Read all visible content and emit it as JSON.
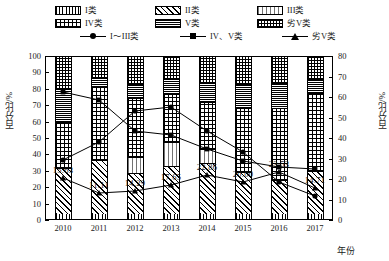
{
  "chart_data": {
    "type": "bar",
    "title": "",
    "xlabel": "年份",
    "ylabel": "百分比/%",
    "ylabel_right": "百分比/%",
    "categories": [
      "2010",
      "2011",
      "2012",
      "2013",
      "2014",
      "2015",
      "2016",
      "2017"
    ],
    "ylim": [
      0,
      100
    ],
    "ylim_right": [
      0,
      80
    ],
    "yticks": [
      "0",
      "10",
      "20",
      "30",
      "40",
      "50",
      "60",
      "70",
      "80",
      "90",
      "100"
    ],
    "yticks_right": [
      "0",
      "10",
      "20",
      "30",
      "40",
      "50",
      "60",
      "70",
      "80"
    ],
    "grid": false,
    "legend_position": "top",
    "stacked": true,
    "series": [
      {
        "name": "I类",
        "pattern": "vertical-bars",
        "values": [
          3.1,
          2.8,
          3.0,
          3.0,
          2.9,
          2.9,
          2.9,
          3.0
        ]
      },
      {
        "name": "II类",
        "pattern": "diagonal-hatch",
        "values": [
          28.0,
          33.3,
          25.0,
          29.4,
          31.4,
          26.0,
          21.0,
          26.5
        ]
      },
      {
        "name": "III类",
        "pattern": "sparse-dots",
        "values": [
          0.0,
          0.0,
          10.0,
          14.7,
          8.6,
          0.0,
          0.0,
          0.0
        ]
      },
      {
        "name": "IV类",
        "pattern": "coarse-checker",
        "values": [
          28.1,
          44.4,
          35.7,
          29.4,
          28.6,
          39.0,
          44.1,
          47.1
        ]
      },
      {
        "name": "V类",
        "pattern": "dense-lines",
        "values": [
          20.3,
          5.6,
          8.6,
          8.8,
          11.4,
          14.7,
          14.7,
          8.8
        ]
      },
      {
        "name": "劣V类",
        "pattern": "fine-cross",
        "values": [
          20.5,
          13.9,
          17.7,
          14.7,
          17.1,
          17.4,
          17.3,
          14.6
        ]
      }
    ],
    "line_series": [
      {
        "name": "I~III类",
        "marker": "circle",
        "axis": "right",
        "values": [
          25.0,
          36.4,
          46.9,
          53.1,
          52.8,
          34.4,
          15.2,
          9.4
        ],
        "pixel_y": [
          160,
          142,
          111,
          107,
          131,
          152,
          182,
          196
        ]
      },
      {
        "name": "IV、V类",
        "marker": "square",
        "axis": "right",
        "values": [
          59.4,
          52.0,
          40.0,
          30.6,
          31.4,
          45.3,
          58.8,
          63.0
        ],
        "pixel_y": [
          92,
          100,
          131,
          135,
          149,
          161,
          167,
          169
        ]
      },
      {
        "name": "劣V类",
        "marker": "triangle",
        "axis": "right",
        "values": [
          15.63,
          11.11,
          14.29,
          17.65,
          22.86,
          20.0,
          23.53,
          14.71
        ],
        "labels": [
          "15.63",
          "11.11",
          "14.29",
          "17.65",
          "22.86",
          "20.00",
          "23.53",
          "14.71"
        ],
        "pixel_y": [
          178,
          193,
          191,
          185,
          175,
          182,
          172,
          188
        ]
      }
    ]
  },
  "legend": {
    "items": [
      {
        "key": "I",
        "label": "I类",
        "pattern": "vertical-bars",
        "type": "swatch"
      },
      {
        "key": "II",
        "label": "II类",
        "pattern": "diagonal-hatch",
        "type": "swatch"
      },
      {
        "key": "III",
        "label": "III类",
        "pattern": "sparse-dots",
        "type": "swatch"
      },
      {
        "key": "IV",
        "label": "IV类",
        "pattern": "coarse-checker",
        "type": "swatch"
      },
      {
        "key": "V",
        "label": "V类",
        "pattern": "dense-lines",
        "type": "swatch"
      },
      {
        "key": "VI",
        "label": "劣V类",
        "pattern": "fine-cross",
        "type": "swatch"
      },
      {
        "key": "L1",
        "label": "I～III类",
        "marker": "circle",
        "type": "line"
      },
      {
        "key": "L2",
        "label": "IV、V类",
        "marker": "square",
        "type": "line"
      },
      {
        "key": "L3",
        "label": "劣V类",
        "marker": "triangle",
        "type": "line"
      }
    ]
  },
  "colors": {
    "ink": "#000000",
    "background": "#ffffff"
  }
}
